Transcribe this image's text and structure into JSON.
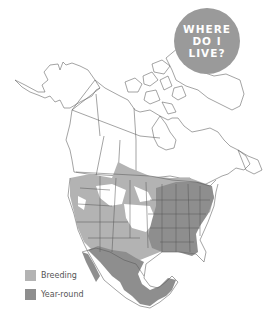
{
  "badge": {
    "lines": [
      "WHERE",
      "DO I",
      "LIVE?"
    ],
    "color": "#9a9a9a"
  },
  "legend": {
    "items": [
      {
        "label": "Breeding",
        "color": "#b3b3b3"
      },
      {
        "label": "Year-round",
        "color": "#8e8e8e"
      }
    ]
  },
  "map": {
    "region": "North America",
    "outline_color": "#555555",
    "land_color": "#ffffff"
  }
}
